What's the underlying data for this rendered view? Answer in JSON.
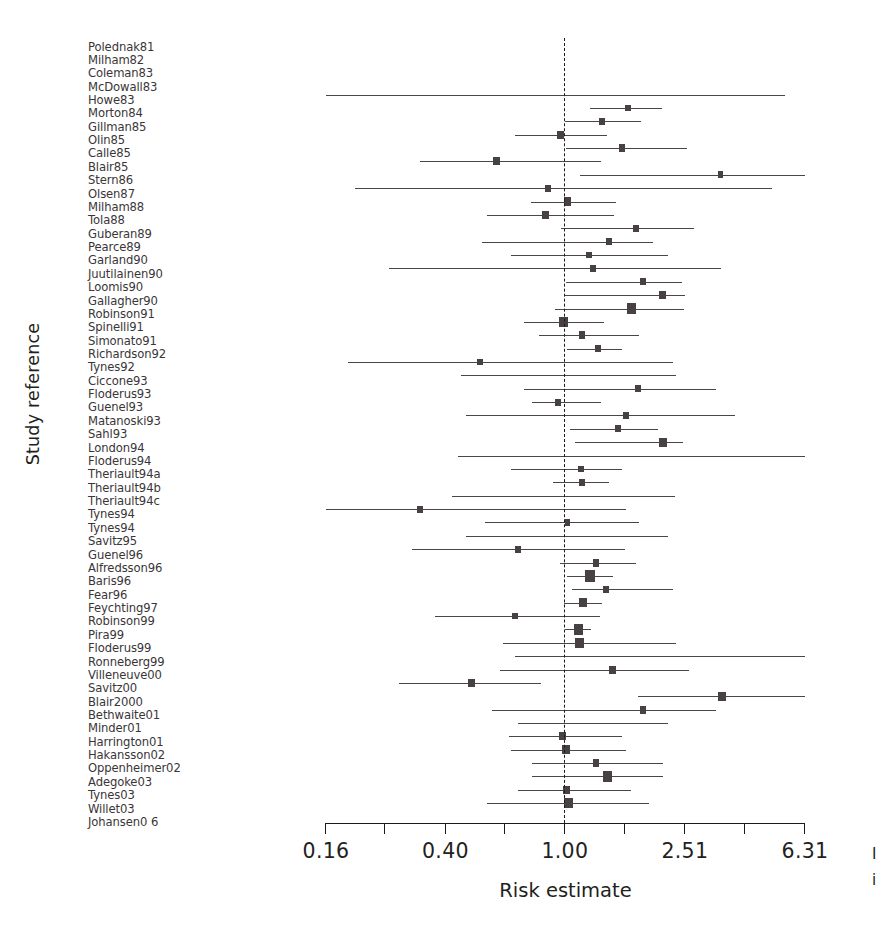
{
  "figure": {
    "type": "forest-plot",
    "y_axis_title": "Study reference",
    "x_axis_title": "Risk estimate",
    "reference_value": 1.0
  },
  "edge_fragment": {
    "line1": "I",
    "line2": "i"
  },
  "chart_data": {
    "type": "scatter",
    "subtype": "forest-plot",
    "title": "",
    "xlabel": "Risk estimate",
    "ylabel": "Study reference",
    "xscale": "log",
    "xlim": [
      0.16,
      6.31
    ],
    "grid": false,
    "legend": "none",
    "reference_line": 1.0,
    "tick_labels": [
      "0.16",
      "0.40",
      "1.00",
      "2.51",
      "6.31"
    ],
    "tick_values": [
      0.16,
      0.4,
      1.0,
      2.51,
      6.31
    ],
    "minor_tick_values": [
      0.252,
      0.631,
      1.585,
      3.98
    ],
    "categories": [
      "Polednak81",
      "Milham82",
      "Coleman83",
      "McDowall83",
      "Howe83",
      "Morton84",
      "Gillman85",
      "Olin85",
      "Calle85",
      "Blair85",
      "Stern86",
      "Olsen87",
      "Milham88",
      "Tola88",
      "Guberan89",
      "Pearce89",
      "Garland90",
      "Juutilainen90",
      "Loomis90",
      "Gallagher90",
      "Robinson91",
      "Spinelli91",
      "Simonato91",
      "Richardson92",
      "Tynes92",
      "Ciccone93",
      "Floderus93",
      "Guenel93",
      "Matanoski93",
      "Sahl93",
      "London94",
      "Floderus94",
      "Theriault94a",
      "Theriault94b",
      "Theriault94c",
      "Tynes94",
      "Tynes94",
      "Savitz95",
      "Guenel96",
      "Alfredsson96",
      "Baris96",
      "Fear96",
      "Feychting97",
      "Robinson99",
      "Pira99",
      "Floderus99",
      "Ronneberg99",
      "Villeneuve00",
      "Savitz00",
      "Blair2000",
      "Bethwaite01",
      "Minder01",
      "Harrington01",
      "Hakansson02",
      "Oppenheimer02",
      "Adegoke03",
      "Tynes03",
      "Willet03",
      "Johansen0 6"
    ],
    "studies": [
      {
        "label": "Polednak81",
        "estimate": null,
        "lower": null,
        "upper": null,
        "weight": 0
      },
      {
        "label": "Milham82",
        "estimate": null,
        "lower": null,
        "upper": null,
        "weight": 0
      },
      {
        "label": "Coleman83",
        "estimate": null,
        "lower": null,
        "upper": null,
        "weight": 0
      },
      {
        "label": "McDowall83",
        "estimate": 1.0,
        "lower": 0.16,
        "upper": 5.4,
        "weight": 0
      },
      {
        "label": "Howe83",
        "estimate": 1.62,
        "lower": 1.21,
        "upper": 2.1,
        "weight": 2
      },
      {
        "label": "Morton84",
        "estimate": 1.33,
        "lower": 1.0,
        "upper": 1.8,
        "weight": 2
      },
      {
        "label": "Gillman85",
        "estimate": 0.97,
        "lower": 0.68,
        "upper": 1.38,
        "weight": 3
      },
      {
        "label": "Olin85",
        "estimate": 1.55,
        "lower": 1.01,
        "upper": 2.55,
        "weight": 3
      },
      {
        "label": "Calle85",
        "estimate": 0.59,
        "lower": 0.33,
        "upper": 1.32,
        "weight": 3
      },
      {
        "label": "Blair85",
        "estimate": 3.3,
        "lower": 1.12,
        "upper": 6.31,
        "weight": 2
      },
      {
        "label": "Stern86",
        "estimate": 0.88,
        "lower": 0.2,
        "upper": 4.9,
        "weight": 2
      },
      {
        "label": "Olsen87",
        "estimate": 1.02,
        "lower": 0.77,
        "upper": 1.48,
        "weight": 4
      },
      {
        "label": "Milham88",
        "estimate": 0.86,
        "lower": 0.55,
        "upper": 1.46,
        "weight": 3
      },
      {
        "label": "Tola88",
        "estimate": 1.73,
        "lower": 0.97,
        "upper": 2.7,
        "weight": 2
      },
      {
        "label": "Guberan89",
        "estimate": 1.4,
        "lower": 0.53,
        "upper": 1.96,
        "weight": 2
      },
      {
        "label": "Pearce89",
        "estimate": 1.2,
        "lower": 0.66,
        "upper": 2.2,
        "weight": 2
      },
      {
        "label": "Garland90",
        "estimate": 1.24,
        "lower": 0.26,
        "upper": 3.3,
        "weight": 2
      },
      {
        "label": "Juutilainen90",
        "estimate": 1.82,
        "lower": 1.01,
        "upper": 2.46,
        "weight": 2
      },
      {
        "label": "Loomis90",
        "estimate": 2.11,
        "lower": 0.99,
        "upper": 2.51,
        "weight": 3
      },
      {
        "label": "Gallagher90",
        "estimate": 1.67,
        "lower": 0.93,
        "upper": 2.49,
        "weight": 5
      },
      {
        "label": "Robinson91",
        "estimate": 0.99,
        "lower": 0.73,
        "upper": 1.35,
        "weight": 5
      },
      {
        "label": "Spinelli91",
        "estimate": 1.14,
        "lower": 0.82,
        "upper": 1.77,
        "weight": 3
      },
      {
        "label": "Simonato91",
        "estimate": 1.29,
        "lower": 1.02,
        "upper": 1.55,
        "weight": 2
      },
      {
        "label": "Richardson92",
        "estimate": 0.52,
        "lower": 0.19,
        "upper": 2.3,
        "weight": 2
      },
      {
        "label": "Tynes92",
        "estimate": 1.0,
        "lower": 0.45,
        "upper": 2.34,
        "weight": 0
      },
      {
        "label": "Ciccone93",
        "estimate": 1.75,
        "lower": 0.73,
        "upper": 3.2,
        "weight": 2
      },
      {
        "label": "Floderus93",
        "estimate": 0.95,
        "lower": 0.78,
        "upper": 1.32,
        "weight": 2
      },
      {
        "label": "Guenel93",
        "estimate": 1.6,
        "lower": 0.47,
        "upper": 3.7,
        "weight": 2
      },
      {
        "label": "Matanoski93",
        "estimate": 1.5,
        "lower": 1.04,
        "upper": 2.05,
        "weight": 2
      },
      {
        "label": "Sahl93",
        "estimate": 2.12,
        "lower": 1.08,
        "upper": 2.48,
        "weight": 4
      },
      {
        "label": "London94",
        "estimate": 1.0,
        "lower": 0.44,
        "upper": 6.31,
        "weight": 0
      },
      {
        "label": "Floderus94",
        "estimate": 1.13,
        "lower": 0.66,
        "upper": 1.55,
        "weight": 2
      },
      {
        "label": "Theriault94a",
        "estimate": 1.14,
        "lower": 0.91,
        "upper": 1.4,
        "weight": 2
      },
      {
        "label": "Theriault94b",
        "estimate": 1.0,
        "lower": 0.42,
        "upper": 2.32,
        "weight": 0
      },
      {
        "label": "Theriault94c",
        "estimate": 0.33,
        "lower": 0.16,
        "upper": 1.6,
        "weight": 2
      },
      {
        "label": "Tynes94",
        "estimate": 1.02,
        "lower": 0.54,
        "upper": 1.76,
        "weight": 2
      },
      {
        "label": "Tynes94",
        "estimate": 1.0,
        "lower": 0.47,
        "upper": 2.2,
        "weight": 0
      },
      {
        "label": "Savitz95",
        "estimate": 0.7,
        "lower": 0.31,
        "upper": 1.59,
        "weight": 2
      },
      {
        "label": "Guenel96",
        "estimate": 1.27,
        "lower": 0.96,
        "upper": 1.72,
        "weight": 3
      },
      {
        "label": "Alfredsson96",
        "estimate": 1.21,
        "lower": 1.02,
        "upper": 1.45,
        "weight": 6
      },
      {
        "label": "Baris96",
        "estimate": 1.37,
        "lower": 1.06,
        "upper": 2.3,
        "weight": 2
      },
      {
        "label": "Fear96",
        "estimate": 1.15,
        "lower": 0.99,
        "upper": 1.33,
        "weight": 4
      },
      {
        "label": "Feychting97",
        "estimate": 0.68,
        "lower": 0.37,
        "upper": 1.31,
        "weight": 2
      },
      {
        "label": "Robinson99",
        "estimate": 1.11,
        "lower": 1.0,
        "upper": 1.22,
        "weight": 5
      },
      {
        "label": "Pira99",
        "estimate": 1.12,
        "lower": 0.62,
        "upper": 2.34,
        "weight": 5
      },
      {
        "label": "Floderus99",
        "estimate": 1.0,
        "lower": 0.68,
        "upper": 6.31,
        "weight": 0
      },
      {
        "label": "Ronneberg99",
        "estimate": 1.44,
        "lower": 0.61,
        "upper": 2.6,
        "weight": 3
      },
      {
        "label": "Villeneuve00",
        "estimate": 0.49,
        "lower": 0.28,
        "upper": 0.83,
        "weight": 3
      },
      {
        "label": "Savitz00",
        "estimate": 3.34,
        "lower": 1.75,
        "upper": 6.31,
        "weight": 4
      },
      {
        "label": "Blair2000",
        "estimate": 1.82,
        "lower": 0.57,
        "upper": 3.2,
        "weight": 3
      },
      {
        "label": "Bethwaite01",
        "estimate": 1.0,
        "lower": 0.7,
        "upper": 2.2,
        "weight": 0
      },
      {
        "label": "Minder01",
        "estimate": 0.98,
        "lower": 0.65,
        "upper": 1.55,
        "weight": 3
      },
      {
        "label": "Harrington01",
        "estimate": 1.01,
        "lower": 0.66,
        "upper": 1.6,
        "weight": 4
      },
      {
        "label": "Hakansson02",
        "estimate": 1.27,
        "lower": 0.78,
        "upper": 2.12,
        "weight": 3
      },
      {
        "label": "Oppenheimer02",
        "estimate": 1.39,
        "lower": 0.78,
        "upper": 2.12,
        "weight": 5
      },
      {
        "label": "Adegoke03",
        "estimate": 1.01,
        "lower": 0.7,
        "upper": 1.66,
        "weight": 3
      },
      {
        "label": "Tynes03",
        "estimate": 1.03,
        "lower": 0.55,
        "upper": 1.9,
        "weight": 5
      },
      {
        "label": "Willet03",
        "estimate": null,
        "lower": null,
        "upper": null,
        "weight": 0
      },
      {
        "label": "Johansen0 6",
        "estimate": null,
        "lower": null,
        "upper": null,
        "weight": 0
      }
    ]
  }
}
